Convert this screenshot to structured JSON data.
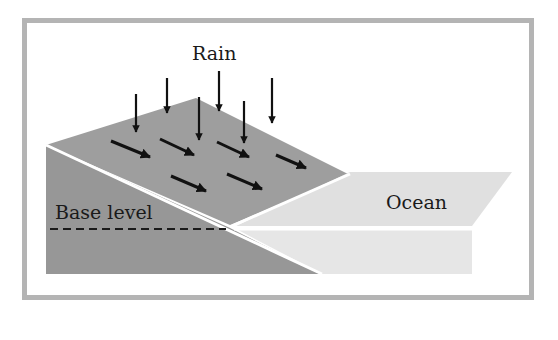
{
  "diagram": {
    "labels": {
      "rain": "Rain",
      "base_level": "Base level",
      "ocean": "Ocean"
    },
    "colors": {
      "frame": "#b4b4b4",
      "land_dark": "#979797",
      "land_top": "#9e9e9e",
      "ocean_light": "#e0e0e0",
      "ocean_lower": "#e6e6e6",
      "arrow": "#111111",
      "divider": "#ffffff"
    },
    "rain_arrow_count": 7,
    "runoff_arrow_count": 6
  }
}
